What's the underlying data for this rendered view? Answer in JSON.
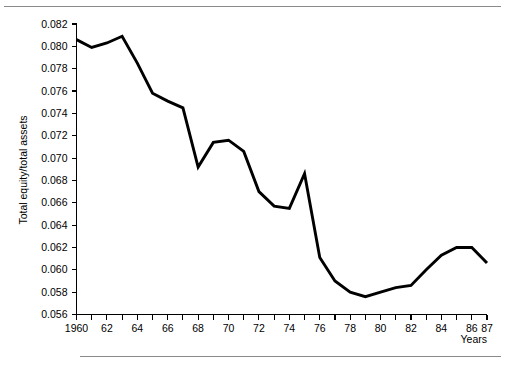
{
  "chart_data": {
    "type": "line",
    "title": "",
    "subtitle": "",
    "xlabel": "Years",
    "ylabel": "Total equity/total assets",
    "xlim": [
      1960,
      1987
    ],
    "ylim": [
      0.056,
      0.082
    ],
    "grid": false,
    "legend": null,
    "x_tick_step": 1,
    "x_label_step": 2,
    "y_tick_step": 0.002,
    "x_tick_labels": [
      "1960",
      "62",
      "64",
      "66",
      "68",
      "70",
      "72",
      "74",
      "76",
      "78",
      "80",
      "82",
      "84",
      "86",
      "87"
    ],
    "x_tick_label_years": [
      1960,
      1962,
      1964,
      1966,
      1968,
      1970,
      1972,
      1974,
      1976,
      1978,
      1980,
      1982,
      1984,
      1986,
      1987
    ],
    "y_tick_labels": [
      "0.056",
      "0.058",
      "0.060",
      "0.062",
      "0.064",
      "0.066",
      "0.068",
      "0.070",
      "0.072",
      "0.074",
      "0.076",
      "0.078",
      "0.080",
      "0.082"
    ],
    "y_tick_values": [
      0.056,
      0.058,
      0.06,
      0.062,
      0.064,
      0.066,
      0.068,
      0.07,
      0.072,
      0.074,
      0.076,
      0.078,
      0.08,
      0.082
    ],
    "x": [
      1960,
      1961,
      1962,
      1963,
      1964,
      1965,
      1966,
      1967,
      1968,
      1969,
      1970,
      1971,
      1972,
      1973,
      1974,
      1975,
      1976,
      1977,
      1978,
      1979,
      1980,
      1981,
      1982,
      1983,
      1984,
      1985,
      1986,
      1987
    ],
    "values": [
      0.0806,
      0.0799,
      0.0803,
      0.0809,
      0.0785,
      0.0758,
      0.0751,
      0.0745,
      0.0692,
      0.0714,
      0.0716,
      0.0706,
      0.067,
      0.0657,
      0.0655,
      0.0686,
      0.0611,
      0.059,
      0.058,
      0.0576,
      0.058,
      0.0584,
      0.0586,
      0.06,
      0.0613,
      0.062,
      0.062,
      0.0606
    ],
    "series": [
      {
        "name": "Total equity/total assets",
        "color": "#000000",
        "values": [
          0.0806,
          0.0799,
          0.0803,
          0.0809,
          0.0785,
          0.0758,
          0.0751,
          0.0745,
          0.0692,
          0.0714,
          0.0716,
          0.0706,
          0.067,
          0.0657,
          0.0655,
          0.0686,
          0.0611,
          0.059,
          0.058,
          0.0576,
          0.058,
          0.0584,
          0.0586,
          0.06,
          0.0613,
          0.062,
          0.062,
          0.0606
        ]
      }
    ]
  },
  "figure": {
    "xlabel": "Years",
    "ylabel": "Total equity/total assets"
  }
}
